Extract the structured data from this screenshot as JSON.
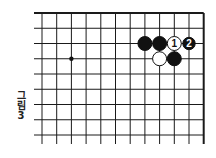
{
  "figure": {
    "caption_chars": [
      "그",
      "림",
      "3"
    ],
    "caption_text": "그림 3"
  },
  "board": {
    "origin_x": 42,
    "origin_y": 13,
    "spacing_x": 14.7,
    "spacing_y": 15.25,
    "columns": 12,
    "rows": 9,
    "line_extend_left": 8,
    "line_extend_bottom": 9,
    "top_edge": true,
    "right_edge": true,
    "line_color": "#1a1a1a",
    "star_points": [
      {
        "col": 2,
        "row": 3
      }
    ],
    "stones": [
      {
        "col": 7,
        "row": 2,
        "color": "black",
        "label": ""
      },
      {
        "col": 8,
        "row": 2,
        "color": "black",
        "label": ""
      },
      {
        "col": 9,
        "row": 2,
        "color": "white",
        "label": "1"
      },
      {
        "col": 10,
        "row": 2,
        "color": "black",
        "label": "2"
      },
      {
        "col": 8,
        "row": 3,
        "color": "white",
        "label": ""
      },
      {
        "col": 9,
        "row": 3,
        "color": "black",
        "label": ""
      }
    ]
  }
}
